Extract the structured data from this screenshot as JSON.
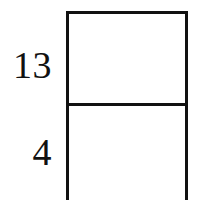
{
  "diagram": {
    "background_color": "#ffffff",
    "stroke_color": "#111111",
    "text_color": "#111111",
    "stroke_width_px": 3,
    "shape": {
      "type": "rectangle",
      "subdivision": "horizontal-divider",
      "parts": 2,
      "cropped_at_bottom": true
    },
    "labels": {
      "upper_segment": "13",
      "lower_segment": "4"
    }
  }
}
